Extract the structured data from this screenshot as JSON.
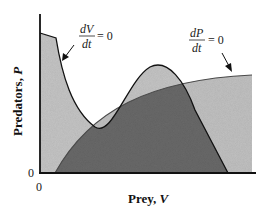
{
  "figure": {
    "type": "phase-plane isocline diagram",
    "x_axis": {
      "label": "Prey, ",
      "label_var": "V",
      "origin_tick": "0"
    },
    "y_axis": {
      "label": "Predators, ",
      "label_var": "P",
      "origin_tick": "0"
    },
    "annotations": [
      {
        "id": "prey-isocline",
        "numerator": "dV",
        "denominator": "dt",
        "equals": "= 0"
      },
      {
        "id": "predator-isocline",
        "numerator": "dP",
        "denominator": "dt",
        "equals": "= 0"
      }
    ],
    "colors": {
      "light_region": "#c4c4c4",
      "dark_region": "#6e6e6e",
      "overlap_light": "#a8a8a8",
      "lines": "#111111"
    }
  }
}
